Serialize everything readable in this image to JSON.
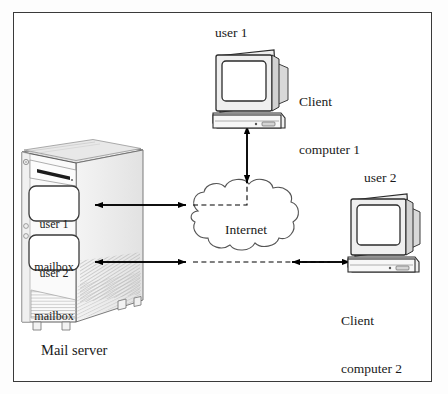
{
  "figure": {
    "type": "network-diagram",
    "background_color": "#ffffff",
    "frame_color": "#3a3a3a",
    "line_color": "#000000"
  },
  "nodes": {
    "mail_server": {
      "caption": "Mail server",
      "device": "tower-computer",
      "mailboxes": [
        {
          "line1": "user 1",
          "line2": "mailbox"
        },
        {
          "line1": "user 2",
          "line2": "mailbox"
        }
      ]
    },
    "cloud": {
      "label": "Internet",
      "shape": "cloud",
      "internal_link_style": "dashed"
    },
    "client1": {
      "user_label": "user 1",
      "caption_line1": "Client",
      "caption_line2": "computer 1",
      "device": "crt-monitor-with-desktop-base"
    },
    "client2": {
      "user_label": "user 2",
      "caption_line1": "Client",
      "caption_line2": "computer 2",
      "device": "crt-monitor-with-desktop-base"
    }
  },
  "connections": [
    {
      "from": "user 1 mailbox",
      "to": "Internet",
      "arrow": "double",
      "orientation": "horizontal"
    },
    {
      "from": "user 2 mailbox",
      "to": "Internet",
      "arrow": "double",
      "orientation": "horizontal"
    },
    {
      "from": "Internet",
      "to": "Client computer 1",
      "arrow": "double",
      "orientation": "vertical"
    },
    {
      "from": "Internet",
      "to": "Client computer 2",
      "arrow": "double",
      "orientation": "horizontal"
    }
  ],
  "footer": {
    "cut_off_caption": ""
  }
}
